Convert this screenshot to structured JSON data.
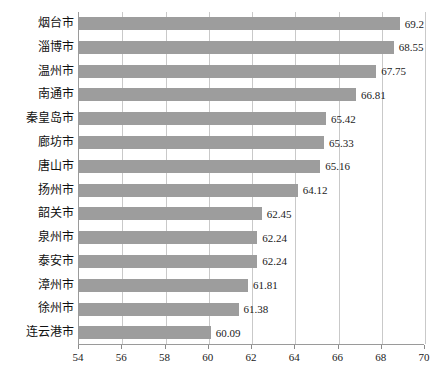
{
  "chart_data": {
    "type": "bar",
    "orientation": "horizontal",
    "title": "",
    "xlabel": "",
    "ylabel": "",
    "xlim": [
      54,
      70
    ],
    "xticks": [
      54,
      56,
      58,
      60,
      62,
      64,
      66,
      68,
      70
    ],
    "grid": true,
    "legend": "none",
    "bar_color": "#9d9d9d",
    "gridline_color": "#c9c9c9",
    "axis_color": "#9a9a9a",
    "categories": [
      "烟台市",
      "淄博市",
      "温州市",
      "南通市",
      "秦皇岛市",
      "廊坊市",
      "唐山市",
      "扬州市",
      "韶关市",
      "泉州市",
      "泰安市",
      "漳州市",
      "徐州市",
      "连云港市"
    ],
    "values": [
      69.2,
      68.55,
      67.75,
      66.81,
      65.42,
      65.33,
      65.16,
      64.12,
      62.45,
      62.24,
      62.24,
      61.81,
      61.38,
      60.09
    ],
    "value_labels": [
      "69.2",
      "68.55",
      "67.75",
      "66.81",
      "65.42",
      "65.33",
      "65.16",
      "64.12",
      "62.45",
      "62.24",
      "62.24",
      "61.81",
      "61.38",
      "60.09"
    ]
  },
  "caption": ""
}
